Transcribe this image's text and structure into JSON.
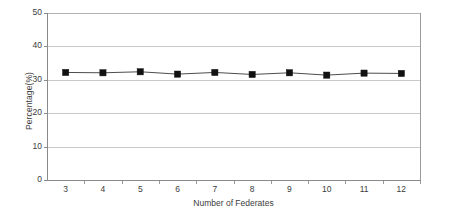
{
  "chart_data": {
    "type": "line",
    "title": "",
    "xlabel": "Number of Federates",
    "ylabel": "Percentage(%)",
    "categories": [
      "3",
      "4",
      "5",
      "6",
      "7",
      "8",
      "9",
      "10",
      "11",
      "12"
    ],
    "x": [
      3,
      4,
      5,
      6,
      7,
      8,
      9,
      10,
      11,
      12
    ],
    "values": [
      32.2,
      32.1,
      32.4,
      31.7,
      32.2,
      31.6,
      32.1,
      31.4,
      32.0,
      31.9
    ],
    "series": [
      {
        "name": "Percentage",
        "values": [
          32.2,
          32.1,
          32.4,
          31.7,
          32.2,
          31.6,
          32.1,
          31.4,
          32.0,
          31.9
        ]
      }
    ],
    "ylim": [
      0,
      50
    ],
    "yticks": [
      0,
      10,
      20,
      30,
      40,
      50
    ],
    "ytick_labels": [
      "0",
      "10",
      "20",
      "30",
      "40",
      "50"
    ],
    "grid": true,
    "grid_axis": "y",
    "legend": false,
    "legend_position": "none",
    "marker": "square",
    "marker_color": "#111111",
    "line_color": "#4d4d4d",
    "background_color": "#ffffff",
    "gridline_color": "#c9c9c9",
    "axis_color": "#8a8a8a"
  },
  "axes": {
    "y_title": "Percentage(%)",
    "x_title": "Number of Federates"
  }
}
